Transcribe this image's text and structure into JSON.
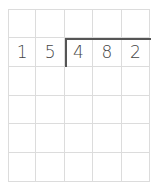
{
  "division": {
    "divisor": [
      "1",
      "5"
    ],
    "dividend": [
      "4",
      "8",
      "2"
    ]
  },
  "grid": {
    "columns": 5,
    "rows": 6,
    "cells": [
      [
        "",
        "",
        "",
        "",
        ""
      ],
      [
        "1",
        "5",
        "4",
        "8",
        "2"
      ],
      [
        "",
        "",
        "",
        "",
        ""
      ],
      [
        "",
        "",
        "",
        "",
        ""
      ],
      [
        "",
        "",
        "",
        "",
        ""
      ],
      [
        "",
        "",
        "",
        "",
        ""
      ]
    ]
  },
  "colors": {
    "grid_line": "#dcdcdc",
    "digit": "#454545",
    "bracket": "#555555"
  }
}
